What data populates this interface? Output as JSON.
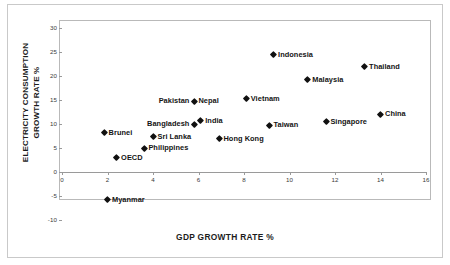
{
  "chart_data": {
    "type": "scatter",
    "title": "",
    "xlabel": "GDP GROWTH RATE %",
    "ylabel_line1": "ELECTRICITY CONSUMPTION",
    "ylabel_line2": "GROWTH RATE %",
    "xlim": [
      0,
      16
    ],
    "ylim": [
      -10,
      30
    ],
    "xticks": [
      "0",
      "2",
      "4",
      "6",
      "8",
      "10",
      "12",
      "14",
      "16"
    ],
    "xtick_values": [
      0,
      2,
      4,
      6,
      8,
      10,
      12,
      14,
      16
    ],
    "yticks": [
      "30",
      "25",
      "20",
      "15",
      "10",
      "5",
      "0",
      "-5",
      "-10"
    ],
    "ytick_values": [
      30,
      25,
      20,
      15,
      10,
      5,
      0,
      -5,
      -10
    ],
    "grid": false,
    "legend": "none",
    "marker": "diamond",
    "marker_color": "#111111",
    "points": [
      {
        "label": "Indonesia",
        "x": 9.3,
        "y": 24.4,
        "label_pos": "right"
      },
      {
        "label": "Thailand",
        "x": 13.3,
        "y": 22.0,
        "label_pos": "right"
      },
      {
        "label": "Malaysia",
        "x": 10.8,
        "y": 19.2,
        "label_pos": "right"
      },
      {
        "label": "Vietnam",
        "x": 8.1,
        "y": 15.3,
        "label_pos": "right"
      },
      {
        "label": "Nepal",
        "x": 5.8,
        "y": 14.8,
        "label_pos": "right"
      },
      {
        "label": "Pakistan",
        "x": 5.8,
        "y": 14.8,
        "label_pos": "left"
      },
      {
        "label": "China",
        "x": 14.0,
        "y": 12.1,
        "label_pos": "right"
      },
      {
        "label": "India",
        "x": 6.1,
        "y": 10.7,
        "label_pos": "right"
      },
      {
        "label": "Bangladesh",
        "x": 5.8,
        "y": 10.0,
        "label_pos": "left"
      },
      {
        "label": "Singapore",
        "x": 11.6,
        "y": 10.6,
        "label_pos": "right"
      },
      {
        "label": "Taiwan",
        "x": 9.1,
        "y": 9.8,
        "label_pos": "right"
      },
      {
        "label": "Brunei",
        "x": 1.85,
        "y": 8.2,
        "label_pos": "right"
      },
      {
        "label": "Sri Lanka",
        "x": 4.0,
        "y": 7.4,
        "label_pos": "right"
      },
      {
        "label": "Hong Kong",
        "x": 6.9,
        "y": 6.9,
        "label_pos": "right"
      },
      {
        "label": "Philippines",
        "x": 3.6,
        "y": 5.0,
        "label_pos": "right"
      },
      {
        "label": "OECD",
        "x": 2.4,
        "y": 3.1,
        "label_pos": "right"
      },
      {
        "label": "Myanmar",
        "x": 2.0,
        "y": -5.8,
        "label_pos": "right"
      }
    ]
  }
}
